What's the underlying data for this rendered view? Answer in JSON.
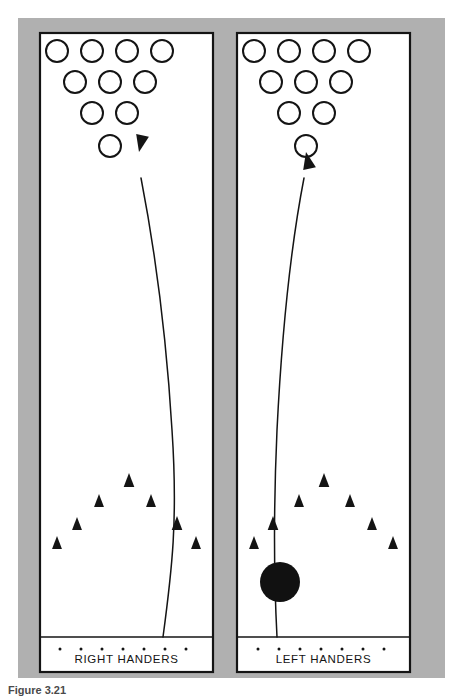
{
  "figure": {
    "caption": "Figure 3.21",
    "background_color": "#ffffff",
    "frame_color": "#b0b0b0",
    "lane_fill": "#ffffff",
    "line_color": "#141414",
    "ball_color": "#111111",
    "frame": {
      "x": 18,
      "y": 18,
      "width": 427,
      "height": 660
    }
  },
  "lanes": [
    {
      "id": "right-handers",
      "label": "RIGHT HANDERS",
      "handedness": "right",
      "panel": {
        "x": 40,
        "y": 33,
        "width": 173,
        "height": 639
      },
      "foul_line_y": 637,
      "label_y": 663,
      "has_ball": false,
      "ball": null,
      "pins": [
        {
          "n": 7,
          "x": 57,
          "y": 51,
          "r": 11
        },
        {
          "n": 8,
          "x": 92,
          "y": 51,
          "r": 11
        },
        {
          "n": 9,
          "x": 127,
          "y": 51,
          "r": 11
        },
        {
          "n": 10,
          "x": 162,
          "y": 51,
          "r": 11
        },
        {
          "n": 4,
          "x": 75,
          "y": 82,
          "r": 11
        },
        {
          "n": 5,
          "x": 110,
          "y": 82,
          "r": 11
        },
        {
          "n": 6,
          "x": 145,
          "y": 82,
          "r": 11
        },
        {
          "n": 2,
          "x": 92,
          "y": 113,
          "r": 11
        },
        {
          "n": 3,
          "x": 127,
          "y": 113,
          "r": 11
        },
        {
          "n": 1,
          "x": 110,
          "y": 146,
          "r": 11
        }
      ],
      "arrows": [
        {
          "i": 1,
          "x": 57,
          "y": 549,
          "size": 13
        },
        {
          "i": 2,
          "x": 77,
          "y": 530,
          "size": 13
        },
        {
          "i": 3,
          "x": 99,
          "y": 507,
          "size": 13
        },
        {
          "i": 4,
          "x": 129,
          "y": 487,
          "size": 14
        },
        {
          "i": 5,
          "x": 151,
          "y": 507,
          "size": 13
        },
        {
          "i": 6,
          "x": 177,
          "y": 530,
          "size": 14
        },
        {
          "i": 7,
          "x": 196,
          "y": 549,
          "size": 13
        }
      ],
      "dots": [
        {
          "x": 60,
          "y": 649
        },
        {
          "x": 81,
          "y": 649
        },
        {
          "x": 102,
          "y": 649
        },
        {
          "x": 123,
          "y": 649
        },
        {
          "x": 144,
          "y": 649
        },
        {
          "x": 165,
          "y": 649
        },
        {
          "x": 186,
          "y": 649
        }
      ],
      "path": "M 163 637 C 172 570, 178 520, 172 430 C 166 330, 153 240, 141 178",
      "arrow_tip": {
        "x": 139,
        "y": 152
      },
      "arrow_angle": -168
    },
    {
      "id": "left-handers",
      "label": "LEFT HANDERS",
      "handedness": "left",
      "panel": {
        "x": 237,
        "y": 33,
        "width": 173,
        "height": 639
      },
      "foul_line_y": 637,
      "label_y": 663,
      "has_ball": true,
      "ball": {
        "x": 280,
        "y": 582,
        "r": 20
      },
      "pins": [
        {
          "n": 10,
          "x": 254,
          "y": 51,
          "r": 11
        },
        {
          "n": 9,
          "x": 289,
          "y": 51,
          "r": 11
        },
        {
          "n": 8,
          "x": 324,
          "y": 51,
          "r": 11
        },
        {
          "n": 7,
          "x": 359,
          "y": 51,
          "r": 11
        },
        {
          "n": 6,
          "x": 271,
          "y": 82,
          "r": 11
        },
        {
          "n": 5,
          "x": 306,
          "y": 82,
          "r": 11
        },
        {
          "n": 4,
          "x": 341,
          "y": 82,
          "r": 11
        },
        {
          "n": 3,
          "x": 289,
          "y": 113,
          "r": 11
        },
        {
          "n": 2,
          "x": 324,
          "y": 113,
          "r": 11
        },
        {
          "n": 1,
          "x": 306,
          "y": 146,
          "r": 11
        }
      ],
      "arrows": [
        {
          "i": 1,
          "x": 254,
          "y": 549,
          "size": 13
        },
        {
          "i": 2,
          "x": 273,
          "y": 530,
          "size": 14
        },
        {
          "i": 3,
          "x": 299,
          "y": 507,
          "size": 13
        },
        {
          "i": 4,
          "x": 324,
          "y": 487,
          "size": 14
        },
        {
          "i": 5,
          "x": 350,
          "y": 507,
          "size": 13
        },
        {
          "i": 6,
          "x": 372,
          "y": 530,
          "size": 13
        },
        {
          "i": 7,
          "x": 393,
          "y": 549,
          "size": 13
        }
      ],
      "dots": [
        {
          "x": 258,
          "y": 649
        },
        {
          "x": 279,
          "y": 649
        },
        {
          "x": 300,
          "y": 649
        },
        {
          "x": 321,
          "y": 649
        },
        {
          "x": 342,
          "y": 649
        },
        {
          "x": 363,
          "y": 649
        },
        {
          "x": 384,
          "y": 649
        }
      ],
      "path": "M 277 637 C 274 580, 273 520, 277 430 C 282 330, 292 240, 304 178",
      "arrow_tip": {
        "x": 306,
        "y": 152
      },
      "arrow_angle": -12
    }
  ]
}
